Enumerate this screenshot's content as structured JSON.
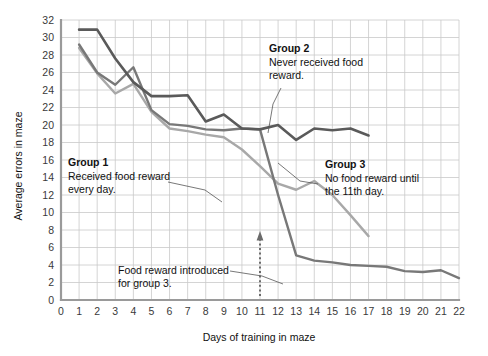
{
  "chart_data": {
    "type": "line",
    "title": "",
    "xlabel": "Days of training in maze",
    "ylabel": "Average errors in maze",
    "xlim": [
      0,
      22
    ],
    "ylim": [
      0,
      32
    ],
    "xticks": [
      0,
      1,
      2,
      3,
      4,
      5,
      6,
      7,
      8,
      9,
      10,
      11,
      12,
      13,
      14,
      15,
      16,
      17,
      18,
      19,
      20,
      21,
      22
    ],
    "yticks": [
      0,
      2,
      4,
      6,
      8,
      10,
      12,
      14,
      16,
      18,
      20,
      22,
      24,
      26,
      28,
      30,
      32
    ],
    "grid": true,
    "legend_position": "inline-annotations",
    "series": [
      {
        "name": "Group 1",
        "color": "#a8a8a8",
        "x": [
          1,
          2,
          3,
          4,
          5,
          6,
          7,
          8,
          9,
          10,
          11,
          12,
          13,
          14,
          15,
          16,
          17
        ],
        "values": [
          28.8,
          25.9,
          23.6,
          24.7,
          21.5,
          19.6,
          19.3,
          18.9,
          18.6,
          17.2,
          15.3,
          13.3,
          12.6,
          13.6,
          12.0,
          9.7,
          7.3
        ]
      },
      {
        "name": "Group 2",
        "color": "#5a5a5a",
        "x": [
          1,
          2,
          3,
          4,
          5,
          6,
          7,
          8,
          9,
          10,
          11,
          12,
          13,
          14,
          15,
          16,
          17
        ],
        "values": [
          30.9,
          30.9,
          27.6,
          24.9,
          23.3,
          23.3,
          23.4,
          20.4,
          21.2,
          19.6,
          19.5,
          20.0,
          18.3,
          19.6,
          19.4,
          19.6,
          18.8
        ]
      },
      {
        "name": "Group 3",
        "color": "#787878",
        "x": [
          1,
          2,
          3,
          4,
          5,
          6,
          7,
          8,
          9,
          10,
          11,
          12,
          13,
          14,
          15,
          16,
          17,
          18,
          19,
          20,
          21,
          22
        ],
        "values": [
          29.2,
          26.0,
          24.6,
          26.6,
          21.7,
          20.1,
          19.9,
          19.5,
          19.4,
          19.6,
          19.5,
          12.0,
          5.1,
          4.5,
          4.3,
          4.0,
          3.9,
          3.8,
          3.3,
          3.2,
          3.4,
          2.5
        ]
      }
    ],
    "annotations": [
      {
        "id": "group-1",
        "title": "Group 1",
        "body_lines": [
          "Received food reward",
          "every day."
        ]
      },
      {
        "id": "group-2",
        "title": "Group 2",
        "body_lines": [
          "Never received food",
          "reward."
        ]
      },
      {
        "id": "group-3",
        "title": "Group 3",
        "body_lines": [
          "No food reward until",
          "the 11th day."
        ]
      },
      {
        "id": "food-reward-marker",
        "title": "",
        "body_lines": [
          "Food reward introduced",
          "for group 3."
        ],
        "marker_day": 11
      }
    ]
  },
  "colors": {
    "group1": "#a8a8a8",
    "group2": "#5a5a5a",
    "group3": "#787878",
    "grid": "#c9c9c9",
    "axis": "#9a9a9a",
    "text": "#111111",
    "tick_text": "#3a3a3a",
    "leader": "#555555",
    "background": "#ffffff"
  }
}
